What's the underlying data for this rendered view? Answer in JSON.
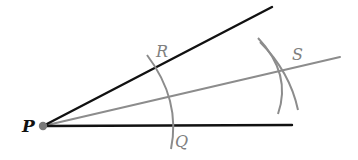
{
  "figure": {
    "labels": {
      "vertex": "P",
      "upper_intersection": "R",
      "lower_intersection": "Q",
      "arc_intersection": "S"
    },
    "colors": {
      "ray": "#111111",
      "construction": "#8c8c8c",
      "label_dark": "#111111",
      "label_light": "#808080",
      "vertex_dot": "#7a7a7a"
    }
  }
}
